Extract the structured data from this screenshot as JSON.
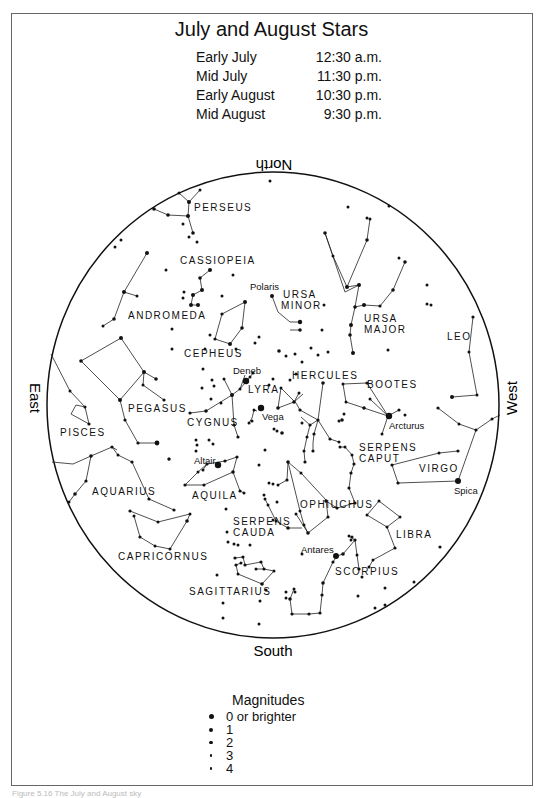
{
  "title": "July and August Stars",
  "viewing_times": [
    {
      "period": "Early July",
      "time": "12:30 a.m."
    },
    {
      "period": "Mid July",
      "time": "11:30 p.m."
    },
    {
      "period": "Early August",
      "time": "10:30 p.m."
    },
    {
      "period": "Mid August",
      "time": "9:30 p.m."
    }
  ],
  "directions": {
    "north": "North",
    "south": "South",
    "east": "East",
    "west": "West"
  },
  "constellations": [
    {
      "name": "PERSEUS",
      "x": 194,
      "y": 211
    },
    {
      "name": "CASSIOPEIA",
      "x": 180,
      "y": 264
    },
    {
      "name": "URSA",
      "x": 283,
      "y": 298
    },
    {
      "name": "MINOR",
      "x": 281,
      "y": 309
    },
    {
      "name": "URSA",
      "x": 364,
      "y": 322
    },
    {
      "name": "MAJOR",
      "x": 364,
      "y": 333
    },
    {
      "name": "ANDROMEDA",
      "x": 130,
      "y": 319
    },
    {
      "name": "LEO",
      "x": 447,
      "y": 340
    },
    {
      "name": "CEPHEUS",
      "x": 184,
      "y": 357
    },
    {
      "name": "HERCULES",
      "x": 292,
      "y": 379
    },
    {
      "name": "BOOTES",
      "x": 367,
      "y": 388
    },
    {
      "name": "LYRA",
      "x": 248,
      "y": 393
    },
    {
      "name": "PEGASUS",
      "x": 128,
      "y": 412
    },
    {
      "name": "CYGNUS",
      "x": 187,
      "y": 426
    },
    {
      "name": "PISCES",
      "x": 60,
      "y": 436
    },
    {
      "name": "SERPENS",
      "x": 359,
      "y": 451
    },
    {
      "name": "CAPUT",
      "x": 359,
      "y": 462
    },
    {
      "name": "VIRGO",
      "x": 419,
      "y": 472
    },
    {
      "name": "AQUARIUS",
      "x": 92,
      "y": 495
    },
    {
      "name": "AQUILA",
      "x": 192,
      "y": 499
    },
    {
      "name": "OPHIUCHUS",
      "x": 300,
      "y": 508
    },
    {
      "name": "SERPENS",
      "x": 233,
      "y": 525
    },
    {
      "name": "CAUDA",
      "x": 233,
      "y": 536
    },
    {
      "name": "LIBRA",
      "x": 396,
      "y": 538
    },
    {
      "name": "CAPRICORNUS",
      "x": 118,
      "y": 560
    },
    {
      "name": "SCORPIUS",
      "x": 335,
      "y": 575
    },
    {
      "name": "SAGITTARIUS",
      "x": 189,
      "y": 595
    }
  ],
  "named_stars": [
    {
      "name": "Polaris",
      "x": 264,
      "y": 290
    },
    {
      "name": "Deneb",
      "x": 231,
      "y": 372
    },
    {
      "name": "Vega",
      "x": 262,
      "y": 419
    },
    {
      "name": "Arcturus",
      "x": 389,
      "y": 427
    },
    {
      "name": "Altair",
      "x": 194,
      "y": 465
    },
    {
      "name": "Spica",
      "x": 453,
      "y": 494
    },
    {
      "name": "Antares",
      "x": 299,
      "y": 553
    }
  ],
  "legend": {
    "title": "Magnitudes",
    "items": [
      {
        "label": "0 or brighter",
        "size": 5
      },
      {
        "label": "1",
        "size": 4
      },
      {
        "label": "2",
        "size": 3.4
      },
      {
        "label": "3",
        "size": 2.8
      },
      {
        "label": "4",
        "size": 2.2
      }
    ]
  },
  "caption": "Figure 5.16 The July and August sky"
}
